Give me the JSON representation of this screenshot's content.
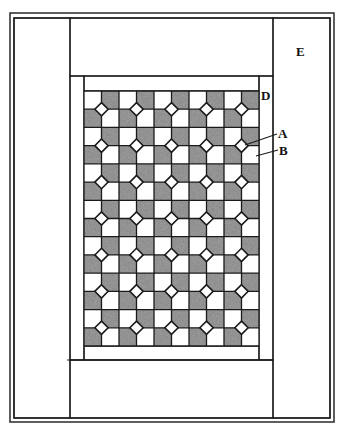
{
  "diagram": {
    "type": "quilt-layout",
    "colors": {
      "line": "#1a1a1a",
      "fabric_dark": "#8a8a8a",
      "fabric_light": "#ffffff",
      "background": "#ffffff"
    },
    "frame": {
      "outer": {
        "x": 10,
        "y": 13,
        "w": 324,
        "h": 409
      },
      "inner": {
        "x": 14,
        "y": 18,
        "w": 316,
        "h": 400
      }
    },
    "outer_border": {
      "label": "E",
      "left_strip": {
        "x": 14,
        "y": 18,
        "w": 56,
        "h": 400
      },
      "right_strip": {
        "x": 273,
        "y": 18,
        "w": 57,
        "h": 400
      },
      "top_strip": {
        "x": 70,
        "y": 18,
        "w": 203,
        "h": 58
      },
      "bottom_strip": {
        "x": 70,
        "y": 360,
        "w": 203,
        "h": 58
      }
    },
    "inner_border": {
      "label": "D",
      "left_strip": {
        "x": 70,
        "y": 76,
        "w": 14,
        "h": 284
      },
      "right_strip": {
        "x": 259,
        "y": 76,
        "w": 14,
        "h": 284
      },
      "top_strip": {
        "x": 84,
        "y": 76,
        "w": 175,
        "h": 15
      },
      "bottom_strip": {
        "x": 84,
        "y": 346,
        "w": 175,
        "h": 14
      }
    },
    "grid": {
      "x": 84,
      "y": 91,
      "w": 175,
      "h": 255,
      "columns": 10,
      "rows": 14,
      "blocks_across": 5,
      "blocks_down": 7,
      "block_description": "Four-patch block: two dark squares (B) and two light squares with clipped corners meeting around a center diamond (A)"
    },
    "labels": [
      {
        "text": "E",
        "x": 296,
        "y": 45
      },
      {
        "text": "D",
        "x": 261,
        "y": 89
      },
      {
        "text": "A",
        "x": 278,
        "y": 127
      },
      {
        "text": "B",
        "x": 279,
        "y": 144
      }
    ],
    "leaders": [
      {
        "for": "A",
        "x1": 245,
        "y1": 145,
        "x2": 277,
        "y2": 134
      },
      {
        "for": "B",
        "x1": 256,
        "y1": 156,
        "x2": 278,
        "y2": 150
      }
    ]
  }
}
